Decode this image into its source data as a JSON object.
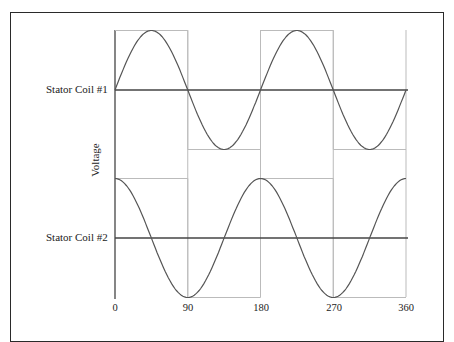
{
  "figure": {
    "y_axis_label": "Voltage",
    "coil_labels": [
      "Stator Coil #1",
      "Stator Coil #2"
    ],
    "x_tick_labels": [
      "0",
      "90",
      "180",
      "270",
      "360"
    ]
  },
  "colors": {
    "frame": "#2a2a2a",
    "sine_curve": "#555555",
    "square_wave": "#bbbbbb",
    "midline": "#444444",
    "text": "#222222"
  },
  "chart_data": {
    "type": "line",
    "title": "",
    "xlabel": "",
    "ylabel": "Voltage",
    "xlim": [
      0,
      360
    ],
    "x_ticks": [
      0,
      90,
      180,
      270,
      360
    ],
    "grid": false,
    "legend": "none",
    "series": [
      {
        "name": "Stator Coil #1",
        "waveform": "sine",
        "x": [
          0,
          45,
          90,
          135,
          180,
          225,
          270,
          315,
          360
        ],
        "values": [
          0,
          1,
          0,
          -1,
          0,
          1,
          0,
          -1,
          0
        ],
        "period_deg": 180,
        "reference_square_wave": {
          "x": [
            0,
            90,
            90,
            180,
            180,
            270,
            270,
            360
          ],
          "values": [
            1,
            1,
            -1,
            -1,
            1,
            1,
            -1,
            -1
          ]
        }
      },
      {
        "name": "Stator Coil #2",
        "waveform": "cosine",
        "x": [
          0,
          45,
          90,
          135,
          180,
          225,
          270,
          315,
          360
        ],
        "values": [
          1,
          0,
          -1,
          0,
          1,
          0,
          -1,
          0,
          1
        ],
        "period_deg": 180,
        "reference_square_wave": {
          "x": [
            0,
            90,
            90,
            180,
            180,
            270,
            270,
            360
          ],
          "values": [
            1,
            1,
            -1,
            -1,
            1,
            1,
            -1,
            -1
          ]
        }
      }
    ]
  }
}
